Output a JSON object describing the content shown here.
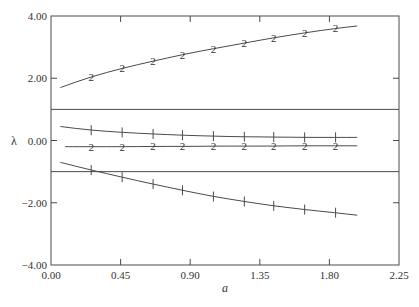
{
  "chart_data": {
    "type": "line",
    "title": "",
    "xlabel": "a",
    "ylabel": "λ",
    "xlim": [
      0.0,
      2.25
    ],
    "ylim": [
      -4.0,
      4.0
    ],
    "grid": false,
    "legend": null,
    "x_ticks": [
      "0.00",
      "0.45",
      "0.90",
      "1.35",
      "1.80",
      "2.25"
    ],
    "x_tick_values": [
      0.0,
      0.45,
      0.9,
      1.35,
      1.8,
      2.25
    ],
    "y_ticks": [
      "4.00",
      "2.00",
      "0.00",
      "-2.00",
      "-4.00"
    ],
    "y_tick_values": [
      4.0,
      2.0,
      0.0,
      -2.0,
      -4.0
    ],
    "horizontal_lines": [
      {
        "name": "upper-bound-line",
        "y": 1.0
      },
      {
        "name": "lower-bound-line",
        "y": -1.0
      }
    ],
    "marker_x": [
      0.26,
      0.46,
      0.66,
      0.85,
      1.05,
      1.25,
      1.44,
      1.64,
      1.84
    ],
    "series": [
      {
        "name": "curve-2-upper",
        "marker": "2",
        "x": [
          0.06,
          0.26,
          0.46,
          0.66,
          0.85,
          1.05,
          1.25,
          1.44,
          1.64,
          1.84,
          1.98
        ],
        "values": [
          1.7,
          2.05,
          2.32,
          2.55,
          2.76,
          2.95,
          3.13,
          3.3,
          3.46,
          3.6,
          3.68
        ]
      },
      {
        "name": "curve-1-upper",
        "marker": "1",
        "x": [
          0.06,
          0.26,
          0.46,
          0.66,
          0.85,
          1.05,
          1.25,
          1.44,
          1.64,
          1.84,
          1.98
        ],
        "values": [
          0.45,
          0.33,
          0.26,
          0.21,
          0.17,
          0.14,
          0.12,
          0.11,
          0.1,
          0.1,
          0.1
        ]
      },
      {
        "name": "curve-2-middle",
        "marker": "2",
        "x": [
          0.09,
          0.26,
          0.46,
          0.66,
          0.85,
          1.05,
          1.25,
          1.44,
          1.64,
          1.84,
          1.98
        ],
        "values": [
          -0.2,
          -0.2,
          -0.2,
          -0.19,
          -0.19,
          -0.18,
          -0.18,
          -0.18,
          -0.17,
          -0.17,
          -0.17
        ]
      },
      {
        "name": "curve-1-lower",
        "marker": "1",
        "x": [
          0.06,
          0.26,
          0.46,
          0.66,
          0.85,
          1.05,
          1.25,
          1.44,
          1.64,
          1.84,
          1.98
        ],
        "values": [
          -0.7,
          -0.95,
          -1.18,
          -1.4,
          -1.6,
          -1.8,
          -1.96,
          -2.1,
          -2.22,
          -2.32,
          -2.4
        ]
      }
    ]
  }
}
